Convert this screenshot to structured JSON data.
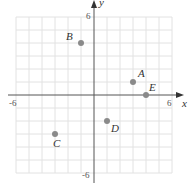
{
  "chart_data": {
    "type": "scatter",
    "title": "",
    "xlabel": "x",
    "ylabel": "y",
    "xlim": [
      -6,
      6
    ],
    "ylim": [
      -6,
      6
    ],
    "grid": true,
    "x_tick_labels": [
      "-6",
      "6"
    ],
    "y_tick_labels": [
      "6",
      "-6"
    ],
    "points": [
      {
        "label": "A",
        "x": 3,
        "y": 1
      },
      {
        "label": "B",
        "x": -1,
        "y": 4
      },
      {
        "label": "C",
        "x": -3,
        "y": -3
      },
      {
        "label": "D",
        "x": 1,
        "y": -2
      },
      {
        "label": "E",
        "x": 4,
        "y": 0
      }
    ]
  },
  "style": {
    "point_color": "#8a8a8a",
    "grid_color": "#e2e2e2",
    "axis_color": "#555555"
  }
}
